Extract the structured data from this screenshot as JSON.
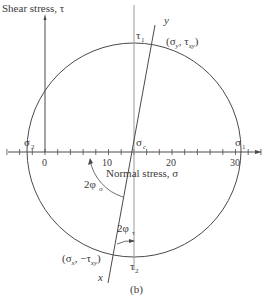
{
  "diagram": {
    "y_axis_label": "Shear stress, τ",
    "x_axis_label": "Normal stress, σ",
    "tick_labels": [
      "0",
      "10",
      "20",
      "30"
    ],
    "tau1": {
      "base": "τ",
      "sub": "1"
    },
    "tau2": {
      "base": "τ",
      "sub": "2"
    },
    "sigma1": {
      "base": "σ",
      "sub": "1"
    },
    "sigma2": {
      "base": "σ",
      "sub": "2"
    },
    "sigma_c": {
      "base": "σ",
      "sub": "c"
    },
    "point_y": "(σy, τxy)",
    "point_y_parts": {
      "open": "(σ",
      "s1": "y",
      "mid": ", τ",
      "s2": "xy",
      "close": ")"
    },
    "point_x_parts": {
      "open": "(σ",
      "s1": "x",
      "mid": ", −τ",
      "s2": "xy",
      "close": ")"
    },
    "axis_y_letter": "y",
    "axis_x_letter": "x",
    "angle_sigma": {
      "base": "2φ",
      "sub": "σ"
    },
    "angle_tau": {
      "base": "2φ",
      "sub": "τ"
    },
    "caption": "(b)",
    "line_color": "#4a4a4a",
    "light_line_color": "#9a9a9a"
  }
}
